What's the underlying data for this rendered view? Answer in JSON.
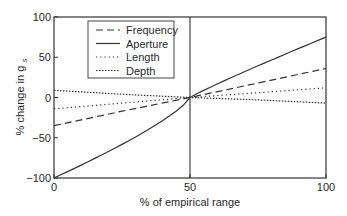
{
  "chart_data": {
    "type": "line",
    "title": "",
    "xlabel": "% of empirical range",
    "ylabel": "% change in g",
    "ylabel_subscript": "s",
    "xlim": [
      0,
      100
    ],
    "ylim": [
      -100,
      100
    ],
    "x_ticks": [
      0,
      50,
      100
    ],
    "y_ticks": [
      -100,
      -50,
      0,
      50,
      100
    ],
    "x_tick_labels": [
      "0",
      "50",
      "100"
    ],
    "y_tick_labels": [
      "−100",
      "−50",
      "0",
      "50",
      "100"
    ],
    "grid": false,
    "vertical_reference_line_x": 50,
    "legend_position": "upper-left",
    "x": [
      0,
      25,
      50,
      75,
      100
    ],
    "series": [
      {
        "name": "Frequency",
        "style": "dashed",
        "values": [
          -35,
          -17,
          0,
          18,
          36
        ]
      },
      {
        "name": "Aperture",
        "style": "solid",
        "values": [
          -100,
          -45,
          0,
          39,
          75
        ]
      },
      {
        "name": "Length",
        "style": "dotted",
        "values": [
          -14,
          -7,
          0,
          6,
          12
        ]
      },
      {
        "name": "Depth",
        "style": "densely-dotted",
        "values": [
          9,
          4,
          0,
          -3,
          -7
        ]
      }
    ]
  }
}
